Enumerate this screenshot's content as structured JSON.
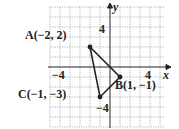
{
  "diagram": {
    "type": "coordinate-plane-triangle",
    "axes": {
      "x_label": "x",
      "y_label": "y"
    },
    "ticks": {
      "x_neg": "−4",
      "x_pos": "4",
      "y_pos": "4",
      "y_neg": "−4"
    },
    "points": [
      {
        "name": "A",
        "label": "A(−2, 2)",
        "x": -2,
        "y": 2
      },
      {
        "name": "B",
        "label": "B(1, −1)",
        "x": 1,
        "y": -1
      },
      {
        "name": "C",
        "label": "C(−1, −3)",
        "x": -1,
        "y": -3
      }
    ],
    "grid": {
      "xmin": -6,
      "xmax": 5,
      "ymin": -6,
      "ymax": 6
    }
  }
}
